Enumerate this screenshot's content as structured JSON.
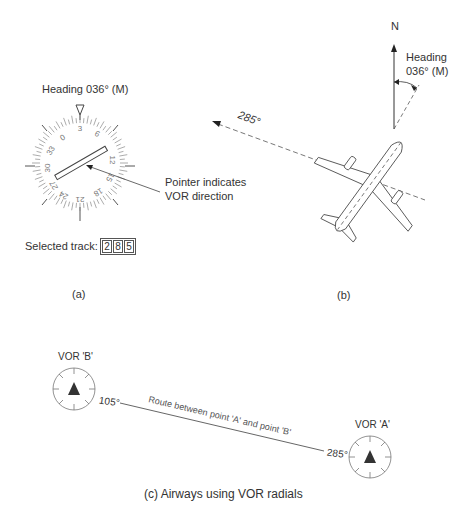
{
  "panel_a": {
    "heading_label": "Heading 036° (M)",
    "compass_numbers": [
      "3",
      "6",
      "W",
      "12",
      "15",
      "S",
      "21",
      "24",
      "E",
      "30",
      "33",
      "N"
    ],
    "pointer_label_line1": "Pointer indicates",
    "pointer_label_line2": "VOR direction",
    "selected_track_label": "Selected track:",
    "selected_track_digits": [
      "2",
      "8",
      "5"
    ],
    "caption": "(a)"
  },
  "panel_b": {
    "north_label": "N",
    "heading_line1": "Heading",
    "heading_line2": "036° (M)",
    "bearing_label": "285°",
    "caption": "(b)"
  },
  "panel_c": {
    "vor_b_label": "VOR 'B'",
    "vor_a_label": "VOR 'A'",
    "radial_b": "105°",
    "radial_a": "285°",
    "route_label": "Route between point 'A' and point 'B'",
    "caption": "(c) Airways using VOR radials"
  }
}
